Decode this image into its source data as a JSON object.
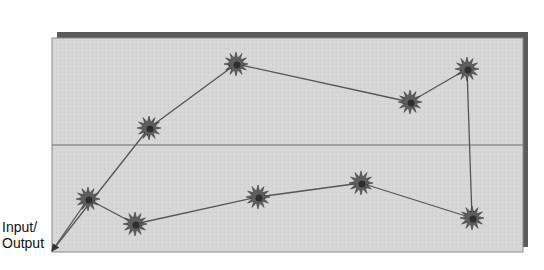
{
  "diagram": {
    "type": "path-through-nodes",
    "labels": {
      "io_line1": "Input/",
      "io_line2": "Output"
    },
    "colors": {
      "background": "#ffffff",
      "panel_fill": "#d6d6d6",
      "panel_border": "#8a8a8a",
      "panel_shadow": "#5a5a5a",
      "divider": "#6e6e6e",
      "edge": "#555555",
      "node_fill": "#5e5e5e",
      "node_core": "#2e2e2e"
    },
    "panel": {
      "x": 52,
      "y": 38,
      "width": 471,
      "height": 214
    },
    "divider_y": 145,
    "io_point": {
      "x": 52,
      "y": 251
    },
    "nodes": [
      {
        "id": "A",
        "x": 236,
        "y": 64
      },
      {
        "id": "B",
        "x": 149,
        "y": 128
      },
      {
        "id": "C",
        "x": 410,
        "y": 102
      },
      {
        "id": "D",
        "x": 467,
        "y": 69
      },
      {
        "id": "E",
        "x": 88,
        "y": 199
      },
      {
        "id": "F",
        "x": 135,
        "y": 224
      },
      {
        "id": "G",
        "x": 258,
        "y": 197
      },
      {
        "id": "H",
        "x": 361,
        "y": 183
      },
      {
        "id": "I",
        "x": 472,
        "y": 218
      }
    ],
    "edges": [
      {
        "from": "IO",
        "to": "B"
      },
      {
        "from": "B",
        "to": "A"
      },
      {
        "from": "A",
        "to": "C"
      },
      {
        "from": "C",
        "to": "D"
      },
      {
        "from": "D",
        "to": "I"
      },
      {
        "from": "I",
        "to": "H"
      },
      {
        "from": "H",
        "to": "G"
      },
      {
        "from": "G",
        "to": "F"
      },
      {
        "from": "F",
        "to": "E"
      },
      {
        "from": "E",
        "to": "IO"
      }
    ]
  }
}
